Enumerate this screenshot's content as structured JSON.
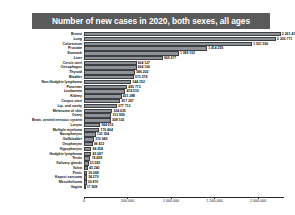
{
  "title": "Number of new cases in 2020, both sexes, all ages",
  "colors": {
    "title_banner_bg": "#5a5a5a",
    "title_text": "#ffffff",
    "bar_fill": "#8f9296",
    "bar_border": "#3d3f42",
    "axis": "#2a2a2a",
    "page_bg": "#ffffff"
  },
  "chart_data": {
    "type": "bar",
    "orientation": "horizontal",
    "title": "Number of new cases in 2020, both sexes, all ages",
    "xlabel": "",
    "ylabel": "",
    "xlim": [
      0,
      2300000
    ],
    "grid": false,
    "legend": false,
    "tick_labels": [
      "0",
      "500 000",
      "1 000 000",
      "1 500 000",
      "2 000 000"
    ],
    "tick_values": [
      0,
      500000,
      1000000,
      1500000,
      2000000
    ],
    "categories": [
      "Breast",
      "Lung",
      "Colorectum",
      "Prostate",
      "Stomach",
      "Liver",
      "Cervix uteri",
      "Oesophagus",
      "Thyroid",
      "Bladder",
      "Non-Hodgkin lymphoma",
      "Pancreas",
      "Leukaemia",
      "Kidney",
      "Corpus uteri",
      "Lip, oral cavity",
      "Melanoma of skin",
      "Ovary",
      "Brain, central nervous system",
      "Larynx",
      "Multiple myeloma",
      "Nasopharynx",
      "Gallbladder",
      "Oropharynx",
      "Hypopharynx",
      "Hodgkin lymphoma",
      "Testis",
      "Salivary glands",
      "Vulva",
      "Penis",
      "Kaposi sarcoma",
      "Mesothelioma",
      "Vagina"
    ],
    "values": [
      2261419,
      2206771,
      1931590,
      1414259,
      1089103,
      905677,
      604127,
      604100,
      586202,
      573278,
      544352,
      495773,
      474519,
      431288,
      417367,
      377713,
      324635,
      313959,
      308102,
      184615,
      176404,
      133354,
      115949,
      98412,
      84254,
      83087,
      74458,
      53583,
      45240,
      36068,
      34270,
      30870,
      17908
    ],
    "value_labels": [
      "2 261 419",
      "2 206 771",
      "1 931 590",
      "1 414 259",
      "1 089 103",
      "905 677",
      "604 127",
      "604 100",
      "586 202",
      "573 278",
      "544 352",
      "495 773",
      "474 519",
      "431 288",
      "417 367",
      "377 713",
      "324 635",
      "313 959",
      "308 102",
      "184 615",
      "176 404",
      "133 354",
      "115 949",
      "98 412",
      "84 254",
      "83 087",
      "74 458",
      "53 583",
      "45 240",
      "36 068",
      "34 270",
      "30 870",
      "17 908"
    ]
  }
}
